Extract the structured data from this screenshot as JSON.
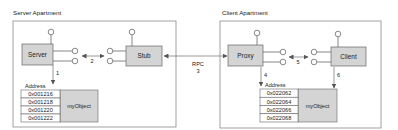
{
  "colors": {
    "component_fill": "#d4d4d4",
    "component_stroke": "#666666",
    "apartment_stroke": "#8a8a8a",
    "line": "#555555",
    "text": "#222222",
    "background": "#ffffff"
  },
  "server_apartment": {
    "title": "Server Apartment",
    "server_label": "Server",
    "stub_label": "Stub",
    "step_1": "1",
    "step_2": "2",
    "memory": {
      "header": "Address",
      "object_label": "myObject",
      "addresses": [
        "0x001216",
        "0x001218",
        "0x001220",
        "0x001222"
      ]
    }
  },
  "rpc": {
    "label": "RPC",
    "step": "3"
  },
  "client_apartment": {
    "title": "Client Apartment",
    "proxy_label": "Proxy",
    "client_label": "Client",
    "step_4": "4",
    "step_5": "5",
    "step_6": "6",
    "memory": {
      "header": "Address",
      "object_label": "myObject",
      "addresses": [
        "0x022062",
        "0x022064",
        "0x022066",
        "0x022068"
      ]
    }
  }
}
